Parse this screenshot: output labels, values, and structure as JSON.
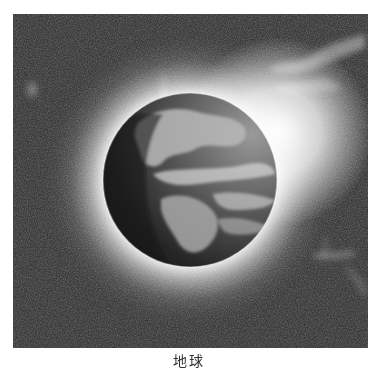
{
  "figure": {
    "style": "grayscale halftone scan",
    "caption": "地球",
    "colors": {
      "space": "#3a3a3a",
      "glow": "#ffffff",
      "globe_dark": "#1e1e1e",
      "land": "#8a8a8a",
      "page": "#ffffff"
    }
  }
}
